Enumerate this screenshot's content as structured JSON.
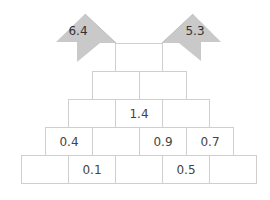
{
  "diagram": {
    "type": "number-pyramid",
    "colors": {
      "brick_border": "#cfcfcf",
      "flag_fill": "#c9c9c9",
      "text": "#444444"
    },
    "flags": [
      {
        "side": "left",
        "value": "6.4"
      },
      {
        "side": "right",
        "value": "5.3"
      }
    ],
    "rows": [
      {
        "cells": [
          ""
        ]
      },
      {
        "cells": [
          "",
          ""
        ]
      },
      {
        "cells": [
          "",
          "1.4",
          ""
        ]
      },
      {
        "cells": [
          "0.4",
          "",
          "0.9",
          "0.7"
        ]
      },
      {
        "cells": [
          "",
          "0.1",
          "",
          "0.5",
          ""
        ]
      }
    ]
  }
}
